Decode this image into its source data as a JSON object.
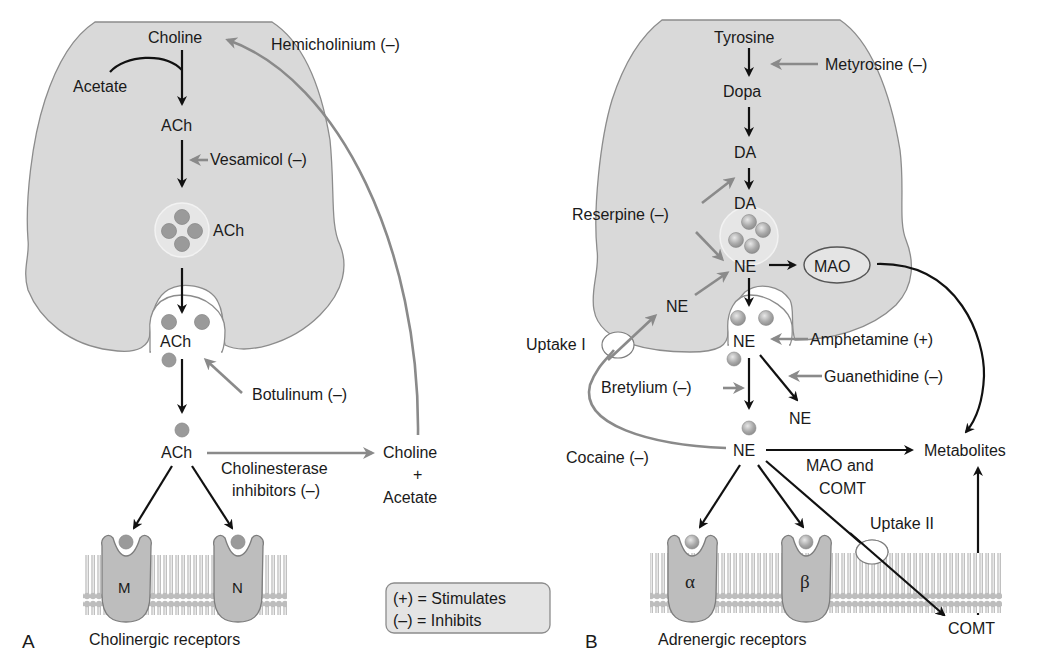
{
  "panel_a": {
    "letter": "A",
    "caption": "Cholinergic receptors",
    "choline": "Choline",
    "acetate": "Acetate",
    "ach_1": "ACh",
    "vesamicol": "Vesamicol (–)",
    "ach_vesicle": "ACh",
    "ach_cleft": "ACh",
    "botulinum": "Botulinum (–)",
    "ach_synapse": "ACh",
    "cholinesterase_line1": "Cholinesterase",
    "cholinesterase_line2": "inhibitors (–)",
    "choline_out": "Choline",
    "plus": "+",
    "acetate_out": "Acetate",
    "hemicholinium": "Hemicholinium (–)",
    "receptor_m": "M",
    "receptor_n": "N"
  },
  "legend": {
    "stimulates": "(+) = Stimulates",
    "inhibits": "(–) = Inhibits"
  },
  "panel_b": {
    "letter": "B",
    "caption": "Adrenergic receptors",
    "tyrosine": "Tyrosine",
    "metyrosine": "Metyrosine (–)",
    "dopa": "Dopa",
    "da_1": "DA",
    "da_2": "DA",
    "reserpine": "Reserpine (–)",
    "ne_vesicle": "NE",
    "mao": "MAO",
    "ne_reuptake": "NE",
    "uptake_1": "Uptake I",
    "ne_cleft": "NE",
    "amphetamine": "Amphetamine (+)",
    "bretylium": "Bretylium (–)",
    "guanethidine": "Guanethidine (–)",
    "ne_displaced": "NE",
    "cocaine": "Cocaine (–)",
    "ne_synapse": "NE",
    "mao_comt_line1": "MAO and",
    "mao_comt_line2": "COMT",
    "metabolites": "Metabolites",
    "uptake_2": "Uptake II",
    "comt": "COMT",
    "receptor_alpha": "α",
    "receptor_beta": "β"
  },
  "colors": {
    "cell_fill": "#d9d9d9",
    "inhibitor_arrow": "#8a8a8a",
    "pathway_arrow": "#111111",
    "legend_fill": "#e4e4e4"
  }
}
